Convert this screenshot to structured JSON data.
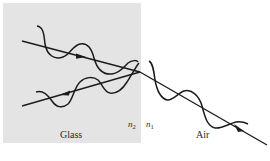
{
  "diagram": {
    "regions": {
      "glass": {
        "label": "Glass",
        "fill": "#e4e4e4"
      },
      "air": {
        "label": "Air",
        "fill": "#ffffff"
      }
    },
    "indices": {
      "glass_side": {
        "symbol": "n",
        "subscript": "2"
      },
      "air_side": {
        "symbol": "n",
        "subscript": "1"
      }
    },
    "rays": [
      {
        "id": "incident",
        "medium": "glass",
        "direction": "toward interface"
      },
      {
        "id": "reflected",
        "medium": "glass",
        "direction": "away from interface"
      },
      {
        "id": "transmitted",
        "medium": "air",
        "direction": "away from interface"
      }
    ],
    "colors": {
      "stroke": "#1c1c1c",
      "glass": "#e4e4e4",
      "text": "#2a2a2a"
    }
  }
}
